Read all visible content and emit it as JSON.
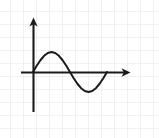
{
  "figure": {
    "width": 159,
    "height": 138,
    "background_color": "#ffffff",
    "grid_color": "#eceef1",
    "grid_spacing_px": 13,
    "axis_color": "#1a1a1a",
    "curve_color": "#1a1a1a",
    "axis_stroke_width": 2.0,
    "curve_stroke_width": 2.0
  },
  "chart_data": {
    "type": "line",
    "title": "",
    "subtitle": "",
    "xlabel": "",
    "ylabel": "",
    "annotations": [],
    "legend": {
      "entries": [],
      "position": "none"
    },
    "grid": true,
    "xtick_labels": [],
    "ytick_labels": [],
    "xlim": [
      -0.25,
      1.35
    ],
    "ylim": [
      -1.9,
      2.6
    ],
    "axes": {
      "x_axis": {
        "label": "",
        "arrow": "right",
        "origin_px": {
          "x": 33,
          "y": 72
        },
        "end_px": {
          "x": 130,
          "y": 72
        }
      },
      "y_axis": {
        "label": "",
        "arrow": "up",
        "origin_px": {
          "x": 33,
          "y": 72
        },
        "top_px": {
          "x": 33,
          "y": 18
        },
        "bottom_px": {
          "x": 33,
          "y": 112
        }
      }
    },
    "series": [
      {
        "name": "sine",
        "function": "y = sin(2*pi*x)",
        "periods": 1,
        "amplitude": 1,
        "x": [
          0.0,
          0.05,
          0.1,
          0.15,
          0.2,
          0.25,
          0.3,
          0.35,
          0.4,
          0.45,
          0.5,
          0.55,
          0.6,
          0.65,
          0.7,
          0.75,
          0.8,
          0.85,
          0.9,
          0.95,
          1.0
        ],
        "values": [
          0.0,
          0.309,
          0.588,
          0.809,
          0.951,
          1.0,
          0.951,
          0.809,
          0.588,
          0.309,
          0.0,
          -0.309,
          -0.588,
          -0.809,
          -0.951,
          -1.0,
          -0.951,
          -0.809,
          -0.588,
          -0.309,
          0.0
        ],
        "key_points": [
          {
            "name": "start-zero-crossing",
            "x": 0.0,
            "y": 0.0,
            "px": {
              "x": 33,
              "y": 72
            }
          },
          {
            "name": "maximum",
            "x": 0.25,
            "y": 1.0,
            "px": {
              "x": 53,
              "y": 52
            }
          },
          {
            "name": "mid-zero-crossing",
            "x": 0.5,
            "y": 0.0,
            "px": {
              "x": 71,
              "y": 72
            }
          },
          {
            "name": "minimum",
            "x": 0.75,
            "y": -1.0,
            "px": {
              "x": 89,
              "y": 92
            }
          },
          {
            "name": "end-zero-crossing",
            "x": 1.0,
            "y": 0.0,
            "px": {
              "x": 107,
              "y": 72
            }
          }
        ]
      }
    ]
  }
}
